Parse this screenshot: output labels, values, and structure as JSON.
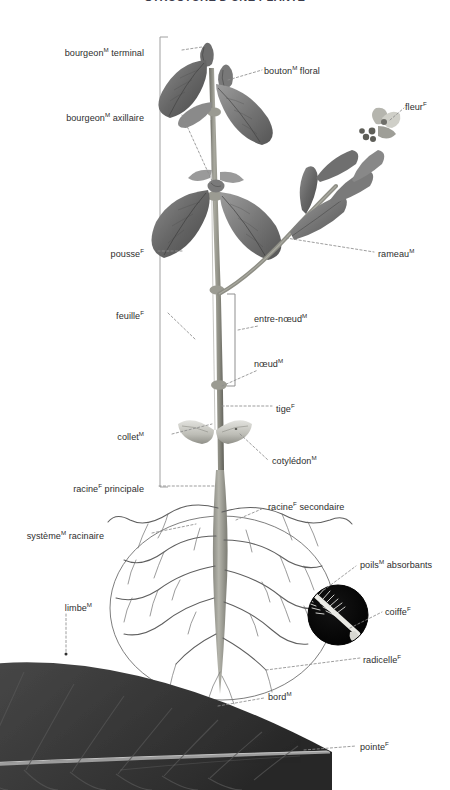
{
  "document": {
    "title": "STRUCTURE D'UNE PLANTE",
    "language": "fr",
    "illustration": "botanical diagram of a plant with labelled parts, root system, magnified root tip inset and leaf close-up"
  },
  "palette": {
    "background": "#ffffff",
    "text": "#2e2e2e",
    "leader_line": "#8d8d8d",
    "bracket": "#9a9a9a",
    "stem": "#8a8a82",
    "foliage_dark": "#5d5d5d",
    "foliage_mid": "#7b7b7b",
    "foliage_light": "#a3a3a3",
    "root": "#9b9b93",
    "root_outline": "#6f6f6f",
    "inset_circle": "#070707",
    "leaf_closeup": "#3a3a3a"
  },
  "labels": {
    "left": [
      {
        "id": "bourgeon-terminal",
        "text": "bourgeon",
        "sup": "M",
        "tail": " terminal",
        "x": 144,
        "y": 50
      },
      {
        "id": "bourgeon-axillaire",
        "text": "bourgeon",
        "sup": "M",
        "tail": " axillaire",
        "x": 144,
        "y": 115
      },
      {
        "id": "pousse",
        "text": "pousse",
        "sup": "F",
        "tail": "",
        "x": 144,
        "y": 251
      },
      {
        "id": "feuille",
        "text": "feuille",
        "sup": "F",
        "tail": "",
        "x": 144,
        "y": 313
      },
      {
        "id": "collet",
        "text": "collet",
        "sup": "M",
        "tail": "",
        "x": 144,
        "y": 434
      },
      {
        "id": "racine-principale",
        "text": "racine",
        "sup": "F",
        "tail": " principale",
        "x": 144,
        "y": 486
      },
      {
        "id": "systeme-racinaire",
        "text": "système",
        "sup": "M",
        "tail": " racinaire",
        "x": 104,
        "y": 533
      },
      {
        "id": "limbe",
        "text": "limbe",
        "sup": "M",
        "tail": "",
        "x": 60,
        "y": 605
      }
    ],
    "right": [
      {
        "id": "bouton-floral",
        "text": "bouton",
        "sup": "M",
        "tail": " floral",
        "x": 264,
        "y": 68
      },
      {
        "id": "fleur",
        "text": "fleur",
        "sup": "F",
        "tail": "",
        "x": 405,
        "y": 104
      },
      {
        "id": "rameau",
        "text": "rameau",
        "sup": "M",
        "tail": "",
        "x": 378,
        "y": 251
      },
      {
        "id": "entre-noeud",
        "text": "entre-nœud",
        "sup": "M",
        "tail": "",
        "x": 254,
        "y": 316
      },
      {
        "id": "noeud",
        "text": "nœud",
        "sup": "M",
        "tail": "",
        "x": 254,
        "y": 361
      },
      {
        "id": "tige",
        "text": "tige",
        "sup": "F",
        "tail": "",
        "x": 276,
        "y": 406
      },
      {
        "id": "cotyledon",
        "text": "cotylédon",
        "sup": "M",
        "tail": "",
        "x": 272,
        "y": 458
      },
      {
        "id": "racine-secondaire",
        "text": "racine",
        "sup": "F",
        "tail": " secondaire",
        "x": 268,
        "y": 504
      },
      {
        "id": "poils-absorbants",
        "text": "poils",
        "sup": "M",
        "tail": " absorbants",
        "x": 360,
        "y": 562
      },
      {
        "id": "coiffe",
        "text": "coiffe",
        "sup": "F",
        "tail": "",
        "x": 385,
        "y": 609
      },
      {
        "id": "radicelle",
        "text": "radicelle",
        "sup": "F",
        "tail": "",
        "x": 363,
        "y": 657
      },
      {
        "id": "bord",
        "text": "bord",
        "sup": "M",
        "tail": "",
        "x": 268,
        "y": 694
      },
      {
        "id": "pointe",
        "text": "pointe",
        "sup": "F",
        "tail": "",
        "x": 360,
        "y": 744
      }
    ]
  }
}
